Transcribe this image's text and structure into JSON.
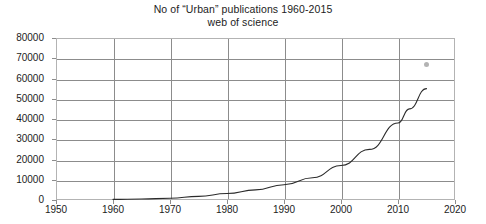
{
  "chart_data": {
    "type": "line",
    "title": "No of “Urban” publications 1960-2015",
    "subtitle": "web of science",
    "xlabel": "",
    "ylabel": "",
    "xlim": [
      1950,
      2020
    ],
    "ylim": [
      0,
      80000
    ],
    "grid": true,
    "legend": "none",
    "x_ticks": [
      1950,
      1960,
      1970,
      1980,
      1990,
      2000,
      2010,
      2020
    ],
    "x_tick_labels": [
      "1950",
      "1960",
      "1970",
      "1980",
      "1990",
      "2000",
      "2010",
      "2020"
    ],
    "y_ticks": [
      0,
      10000,
      20000,
      30000,
      40000,
      50000,
      60000,
      70000,
      80000
    ],
    "y_tick_labels": [
      "0",
      "10000",
      "20000",
      "30000",
      "40000",
      "50000",
      "60000",
      "70000",
      "80000"
    ],
    "series": [
      {
        "name": "No of “Urban” publications",
        "type": "line",
        "color": "#2b2b2b",
        "x": [
          1960,
          1965,
          1970,
          1975,
          1980,
          1985,
          1990,
          1995,
          2000,
          2005,
          2010,
          2012,
          2015
        ],
        "values": [
          300,
          500,
          900,
          1800,
          3200,
          5000,
          7500,
          11000,
          17000,
          25000,
          38000,
          45000,
          55000
        ]
      },
      {
        "name": "outlier-point",
        "type": "scatter",
        "color": "#9a9a9a",
        "x": [
          2015
        ],
        "values": [
          67000
        ]
      }
    ]
  },
  "colors": {
    "line": "#2b2b2b",
    "grid": "#8c8c8c",
    "frame": "#b3b3b3",
    "marker": "#9a9a9a",
    "text": "#1c1c1c",
    "background": "#ffffff"
  }
}
